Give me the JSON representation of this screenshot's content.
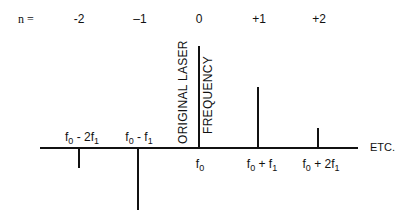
{
  "n_row": {
    "prefix": "n =",
    "orders": [
      {
        "label": "-2",
        "x": 79
      },
      {
        "label": "–1",
        "x": 140
      },
      {
        "label": "0",
        "x": 199
      },
      {
        "label": "+1",
        "x": 259
      },
      {
        "label": "+2",
        "x": 319
      }
    ]
  },
  "center_annotation": {
    "line1": "ORIGINAL LASER",
    "line2": "FREQUENCY"
  },
  "lines": [
    {
      "order": -2,
      "x": 79,
      "direction": "down",
      "length": 19,
      "label_base": "f",
      "label_sub": "0",
      "label_rest": " - 2f",
      "label_sub2": "1",
      "label_pos": "above"
    },
    {
      "order": -1,
      "x": 138,
      "direction": "down",
      "length": 61,
      "label_base": "f",
      "label_sub": "0",
      "label_rest": " - f",
      "label_sub2": "1",
      "label_pos": "above"
    },
    {
      "order": 0,
      "x": 199,
      "direction": "up",
      "length": 102,
      "label_base": "f",
      "label_sub": "0",
      "label_rest": "",
      "label_sub2": "",
      "label_pos": "below"
    },
    {
      "order": 1,
      "x": 258,
      "direction": "up",
      "length": 61,
      "label_base": "f",
      "label_sub": "0",
      "label_rest": " + f",
      "label_sub2": "1",
      "label_pos": "below"
    },
    {
      "order": 2,
      "x": 318,
      "direction": "up",
      "length": 20,
      "label_base": "f",
      "label_sub": "0",
      "label_rest": " + 2f",
      "label_sub2": "1",
      "label_pos": "below"
    }
  ],
  "etc_label": "ETC.",
  "labels": {
    "l_m2": {
      "base": "f",
      "sub": "0",
      "rest": " - 2f",
      "sub2": "1"
    },
    "l_m1": {
      "base": "f",
      "sub": "0",
      "rest": " - f",
      "sub2": "1"
    },
    "l_0": {
      "base": "f",
      "sub": "0"
    },
    "l_p1": {
      "base": "f",
      "sub": "0",
      "rest": " + f",
      "sub2": "1"
    },
    "l_p2": {
      "base": "f",
      "sub": "0",
      "rest": " + 2f",
      "sub2": "1"
    }
  }
}
